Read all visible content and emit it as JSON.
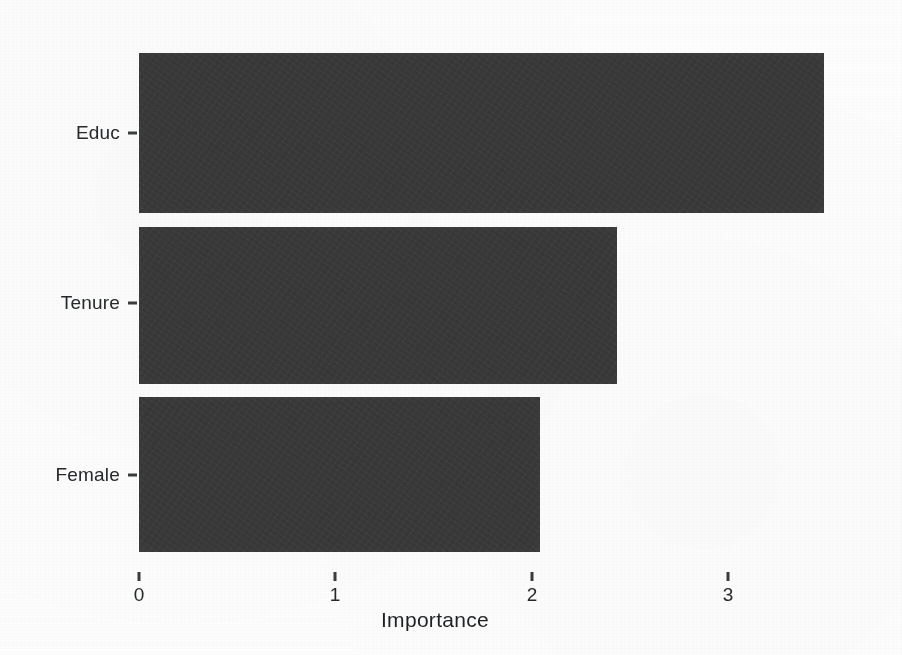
{
  "chart_data": {
    "type": "bar",
    "orientation": "horizontal",
    "title": "",
    "subtitle": "",
    "xlabel": "Importance",
    "ylabel": "",
    "categories": [
      "Educ",
      "Tenure",
      "Female"
    ],
    "values": [
      3.54,
      2.47,
      2.07
    ],
    "series": [
      {
        "name": "Importance",
        "values": [
          3.54,
          2.47,
          2.07
        ]
      }
    ],
    "xlim": [
      0,
      3.72
    ],
    "xticks": [
      0,
      1,
      2,
      3
    ],
    "xtick_labels": [
      "0",
      "1",
      "2",
      "3"
    ],
    "yticks": [
      "Educ",
      "Tenure",
      "Female"
    ],
    "grid": false,
    "legend": false,
    "legend_position": "none",
    "bar_color": "#373737",
    "background_color": "#fdfdfd",
    "axis_text_color": "#26292b",
    "annotations": []
  },
  "axes": {
    "x": {
      "title": "Importance",
      "ticks": [
        {
          "label": "0",
          "value": 0
        },
        {
          "label": "1",
          "value": 1
        },
        {
          "label": "2",
          "value": 2
        },
        {
          "label": "3",
          "value": 3
        }
      ]
    },
    "y": {
      "title": "",
      "ticks": [
        {
          "label": "Educ"
        },
        {
          "label": "Tenure"
        },
        {
          "label": "Female"
        }
      ]
    }
  }
}
